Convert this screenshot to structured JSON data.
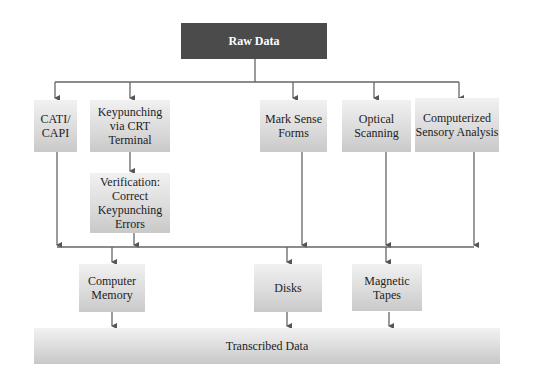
{
  "diagram": {
    "source": {
      "label": "Raw Data"
    },
    "methods": [
      {
        "id": "cati",
        "label": "CATI/ CAPI"
      },
      {
        "id": "keypunch",
        "label": "Keypunching via CRT Terminal"
      },
      {
        "id": "marksense",
        "label": "Mark Sense Forms"
      },
      {
        "id": "optical",
        "label": "Optical Scanning"
      },
      {
        "id": "sensory",
        "label": "Computerized Sensory Analysis"
      }
    ],
    "verification": {
      "label": "Verification: Correct Keypunching Errors"
    },
    "storage": [
      {
        "id": "memory",
        "label": "Computer Memory"
      },
      {
        "id": "disks",
        "label": "Disks"
      },
      {
        "id": "tapes",
        "label": "Magnetic Tapes"
      }
    ],
    "output": {
      "label": "Transcribed Data"
    },
    "colors": {
      "source_fill": "#4b4b4b",
      "box_fill": "#dcdcdc",
      "line": "#555555"
    }
  }
}
